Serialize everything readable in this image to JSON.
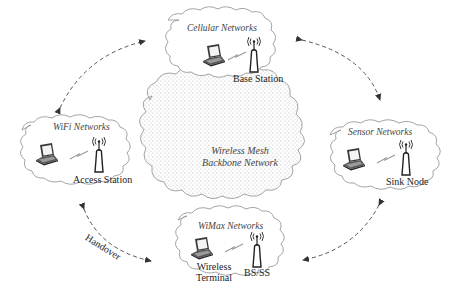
{
  "diagram": {
    "center": {
      "title_line1": "Wireless Mesh",
      "title_line2": "Backbone Network"
    },
    "clouds": [
      {
        "id": "cellular",
        "title": "Cellular Networks",
        "device_left": "",
        "device_right": "Base Station"
      },
      {
        "id": "wifi",
        "title": "WiFi Networks",
        "device_left": "",
        "device_right": "Access Station"
      },
      {
        "id": "sensor",
        "title": "Sensor Networks",
        "device_left": "",
        "device_right": "Sink Node"
      },
      {
        "id": "wimax",
        "title": "WiMax Networks",
        "device_left_line1": "Wireless",
        "device_left_line2": "Terminal",
        "device_right": "BS/SS"
      }
    ],
    "edges": [
      {
        "from": "wifi",
        "to": "cellular",
        "style": "dashed-bidirectional"
      },
      {
        "from": "cellular",
        "to": "sensor",
        "style": "dashed-bidirectional"
      },
      {
        "from": "sensor",
        "to": "wimax",
        "style": "dashed-bidirectional"
      },
      {
        "from": "wifi",
        "to": "wimax",
        "style": "dashed-bidirectional",
        "label": "Handover"
      }
    ],
    "icons": [
      "laptop-icon",
      "antenna-tower-icon",
      "wireless-link-icon"
    ],
    "colors": {
      "cloud_stroke": "#9a9a9a",
      "backbone_dots": "#b8b8b8",
      "arrow": "#555555",
      "text": "#333333"
    }
  }
}
